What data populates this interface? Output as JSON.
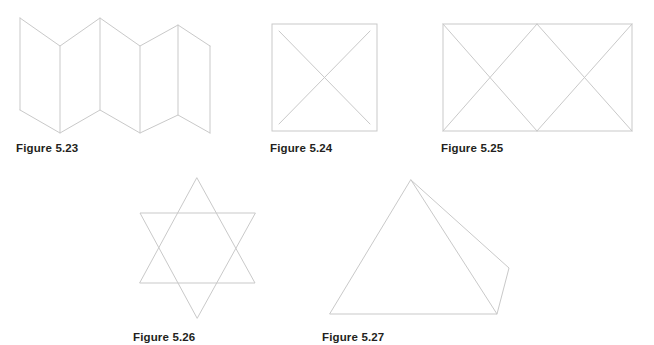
{
  "page": {
    "kind": "geometry-figure-sheet",
    "background_color": "#ffffff",
    "stroke_color": "#c9c9c9",
    "caption_color": "#231f20",
    "stroke_width": 1,
    "width": 654,
    "height": 345
  },
  "figures": [
    {
      "id": "5.23",
      "caption": "Figure 5.23",
      "shape_name": "accordion-folded-strip",
      "description": "Zigzag accordion-folded strip of six panels seen in perspective",
      "caption_position": {
        "x": 16,
        "y": 141
      },
      "bounds": {
        "x": 20,
        "y": 18,
        "width": 212,
        "height": 116
      },
      "vertices_top": [
        [
          20,
          18
        ],
        [
          60,
          46
        ],
        [
          100,
          18
        ],
        [
          140,
          46
        ],
        [
          178,
          25
        ],
        [
          210,
          46
        ]
      ],
      "vertices_bottom": [
        [
          20,
          110
        ],
        [
          60,
          133
        ],
        [
          100,
          110
        ],
        [
          140,
          133
        ],
        [
          178,
          115
        ],
        [
          210,
          133
        ]
      ],
      "fold_lines": [
        [
          [
            20,
            18
          ],
          [
            20,
            110
          ]
        ],
        [
          [
            60,
            46
          ],
          [
            60,
            133
          ]
        ],
        [
          [
            100,
            18
          ],
          [
            100,
            110
          ]
        ],
        [
          [
            140,
            46
          ],
          [
            140,
            133
          ]
        ],
        [
          [
            178,
            25
          ],
          [
            178,
            115
          ]
        ],
        [
          [
            210,
            46
          ],
          [
            210,
            133
          ]
        ]
      ]
    },
    {
      "id": "5.24",
      "caption": "Figure 5.24",
      "shape_name": "square-with-diagonals",
      "description": "Square outline with an X formed by its two diagonals",
      "caption_position": {
        "x": 270,
        "y": 141
      },
      "bounds": {
        "x": 272,
        "y": 24,
        "width": 105,
        "height": 107
      },
      "square": [
        [
          272,
          24
        ],
        [
          377,
          24
        ],
        [
          377,
          131
        ],
        [
          272,
          131
        ]
      ],
      "diagonals": [
        [
          [
            279,
            31
          ],
          [
            370,
            124
          ]
        ],
        [
          [
            370,
            31
          ],
          [
            279,
            124
          ]
        ]
      ]
    },
    {
      "id": "5.25",
      "caption": "Figure 5.25",
      "shape_name": "rectangle-with-zigzag-triangles",
      "description": "Rectangle subdivided by a zigzag into four triangles",
      "caption_position": {
        "x": 441,
        "y": 141
      },
      "bounds": {
        "x": 443,
        "y": 24,
        "width": 189,
        "height": 107
      },
      "rectangle": [
        [
          443,
          24
        ],
        [
          632,
          24
        ],
        [
          632,
          131
        ],
        [
          443,
          131
        ]
      ],
      "zigzag_lines": [
        [
          [
            443,
            24
          ],
          [
            537,
            131
          ]
        ],
        [
          [
            537,
            131
          ],
          [
            632,
            24
          ]
        ],
        [
          [
            443,
            131
          ],
          [
            537,
            24
          ]
        ],
        [
          [
            537,
            24
          ],
          [
            632,
            131
          ]
        ]
      ],
      "crossing_points": [
        [
          490,
          78
        ],
        [
          584,
          78
        ]
      ]
    },
    {
      "id": "5.26",
      "caption": "Figure 5.26",
      "shape_name": "star-of-david-hexagram",
      "description": "Six-pointed star made of two overlapping equilateral triangles",
      "caption_position": {
        "x": 133,
        "y": 330
      },
      "bounds": {
        "x": 140,
        "y": 178,
        "width": 115,
        "height": 140
      },
      "triangle_up": [
        [
          197,
          178
        ],
        [
          255,
          283
        ],
        [
          140,
          283
        ]
      ],
      "triangle_down": [
        [
          197,
          318
        ],
        [
          140,
          213
        ],
        [
          255,
          213
        ]
      ]
    },
    {
      "id": "5.27",
      "caption": "Figure 5.27",
      "shape_name": "pyramid-wireframe",
      "description": "Square-based pyramid drawn in perspective showing two visible faces",
      "caption_position": {
        "x": 322,
        "y": 330
      },
      "bounds": {
        "x": 330,
        "y": 180,
        "width": 180,
        "height": 135
      },
      "apex": [
        411,
        180
      ],
      "base_front_left": [
        330,
        314
      ],
      "base_front_right": [
        497,
        314
      ],
      "base_back_right": [
        509,
        268
      ],
      "edges": [
        [
          [
            411,
            180
          ],
          [
            330,
            314
          ]
        ],
        [
          [
            330,
            314
          ],
          [
            497,
            314
          ]
        ],
        [
          [
            497,
            314
          ],
          [
            411,
            180
          ]
        ],
        [
          [
            411,
            180
          ],
          [
            509,
            268
          ]
        ],
        [
          [
            509,
            268
          ],
          [
            497,
            314
          ]
        ]
      ]
    }
  ]
}
